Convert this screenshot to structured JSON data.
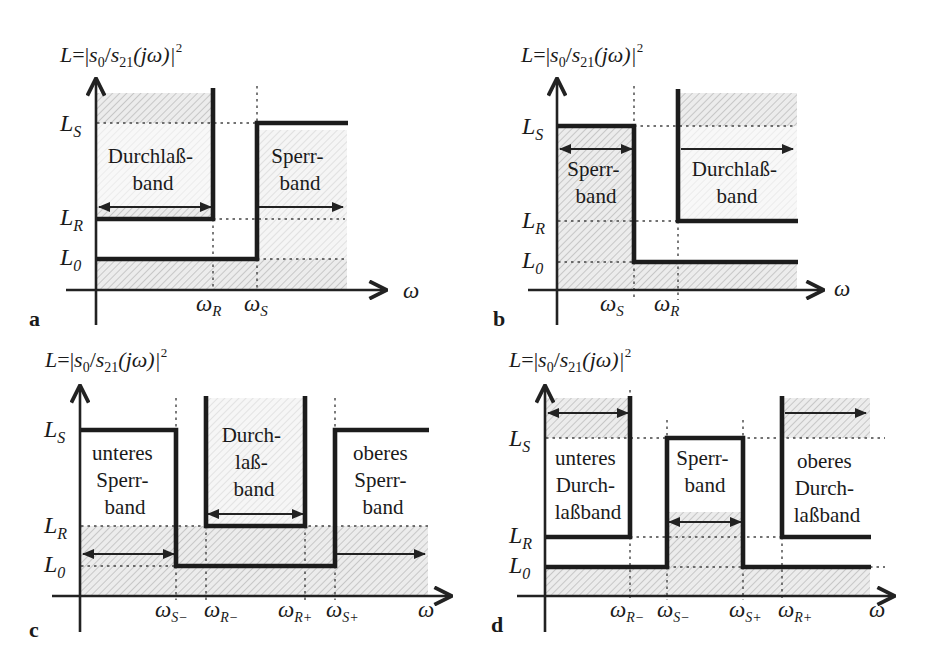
{
  "figure": {
    "y_axis_title": "L=|s₀/s₂₁(jω)|²",
    "y_axis_title_parts": {
      "L": "L",
      "eq": "=|",
      "s0": "s",
      "s0_sub": "0",
      "slash": "/",
      "s21": "s",
      "s21_sub": "21",
      "paren": "(jω)|",
      "sup": "2"
    },
    "x_axis_symbol": "ω",
    "y_levels": {
      "Ls": {
        "base": "L",
        "sub": "S"
      },
      "LR": {
        "base": "L",
        "sub": "R"
      },
      "L0": {
        "base": "L",
        "sub": "0"
      }
    },
    "colors": {
      "curve": "#1c1c1c",
      "hatch": "#b8b8b8",
      "hatch_bg": "#ececec",
      "axis": "#222222"
    }
  },
  "panels": [
    {
      "id": "a",
      "tag": "a",
      "type": "Tiefpass",
      "x_ticks": [
        {
          "base": "ω",
          "sub": "R"
        },
        {
          "base": "ω",
          "sub": "S"
        }
      ],
      "labels": [
        {
          "lines": [
            "Durchlaß-",
            "band"
          ]
        },
        {
          "lines": [
            "Sperr-",
            "band"
          ]
        }
      ]
    },
    {
      "id": "b",
      "tag": "b",
      "type": "Hochpass",
      "x_ticks": [
        {
          "base": "ω",
          "sub": "S"
        },
        {
          "base": "ω",
          "sub": "R"
        }
      ],
      "labels": [
        {
          "lines": [
            "Sperr-",
            "band"
          ]
        },
        {
          "lines": [
            "Durchlaß-",
            "band"
          ]
        }
      ]
    },
    {
      "id": "c",
      "tag": "c",
      "type": "Bandpass",
      "x_ticks": [
        {
          "base": "ω",
          "sub": "S−"
        },
        {
          "base": "ω",
          "sub": "R−"
        },
        {
          "base": "ω",
          "sub": "R+"
        },
        {
          "base": "ω",
          "sub": "S+"
        }
      ],
      "labels": [
        {
          "lines": [
            "unteres",
            "Sperr-",
            "band"
          ]
        },
        {
          "lines": [
            "Durch-",
            "laß-",
            "band"
          ]
        },
        {
          "lines": [
            "oberes",
            "Sperr-",
            "band"
          ]
        }
      ]
    },
    {
      "id": "d",
      "tag": "d",
      "type": "Bandsperre",
      "x_ticks": [
        {
          "base": "ω",
          "sub": "R−"
        },
        {
          "base": "ω",
          "sub": "S−"
        },
        {
          "base": "ω",
          "sub": "S+"
        },
        {
          "base": "ω",
          "sub": "R+"
        }
      ],
      "labels": [
        {
          "lines": [
            "unteres",
            "Durch-",
            "laßband"
          ]
        },
        {
          "lines": [
            "Sperr-",
            "band"
          ]
        },
        {
          "lines": [
            "oberes",
            "Durch-",
            "laßband"
          ]
        }
      ]
    }
  ]
}
